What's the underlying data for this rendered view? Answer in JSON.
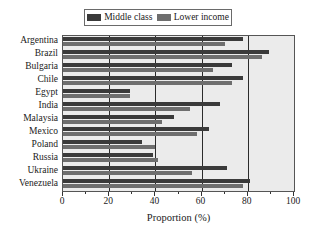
{
  "chart_data": {
    "type": "bar",
    "orientation": "horizontal",
    "title": "",
    "xlabel": "Proportion (%)",
    "ylabel": "",
    "xlim": [
      0,
      100
    ],
    "xticks": [
      0,
      20,
      40,
      60,
      80,
      100
    ],
    "xtick_labels": [
      "0",
      "20",
      "40",
      "60",
      "80",
      "100"
    ],
    "minor_ticks": [
      10,
      30,
      50,
      70,
      90
    ],
    "grid": "vertical",
    "grid_values": [
      20,
      40,
      60,
      80
    ],
    "legend_position": "top-center",
    "categories": [
      "Argentina",
      "Brazil",
      "Bulgaria",
      "Chile",
      "Egypt",
      "India",
      "Malaysia",
      "Mexico",
      "Poland",
      "Russia",
      "Ukraine",
      "Venezuela"
    ],
    "series": [
      {
        "name": "Middle class",
        "color": "#3a3a3a",
        "values": [
          78,
          89,
          73,
          78,
          29,
          68,
          48,
          63,
          34,
          39,
          71,
          81
        ]
      },
      {
        "name": "Lower income",
        "color": "#6e6e6e",
        "values": [
          70,
          86,
          65,
          73,
          29,
          55,
          43,
          58,
          40,
          41,
          56,
          78
        ]
      }
    ]
  },
  "legend": {
    "entries": [
      {
        "label": "Middle class",
        "color": "#3a3a3a"
      },
      {
        "label": "Lower income",
        "color": "#6e6e6e"
      }
    ]
  },
  "axis": {
    "x_title": "Proportion (%)"
  },
  "colors": {
    "plot_background": "#ebebeb",
    "frame": "#555555",
    "gridline": "#2b2b2b",
    "middle_class": "#3a3a3a",
    "lower_income": "#6e6e6e",
    "text": "#1a1a1a"
  }
}
